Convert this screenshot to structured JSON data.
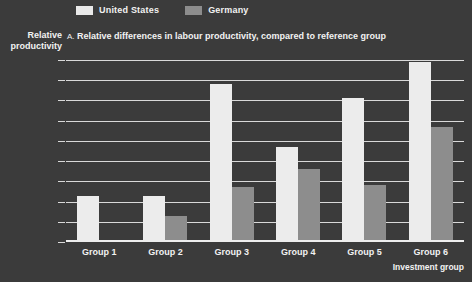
{
  "legend": {
    "position": "top",
    "entries": [
      {
        "label": "United States",
        "color": "#ececec",
        "swatch": "us"
      },
      {
        "label": "Germany",
        "color": "#8d8d8d",
        "swatch": "de"
      }
    ]
  },
  "labels": {
    "y_axis_title_line1": "Relative",
    "y_axis_title_line2": "productivity",
    "panel_letter": "A.",
    "chart_title": "Relative differences in labour productivity, compared to reference group",
    "x_axis_title": "Investment group"
  },
  "chart_data": {
    "type": "bar",
    "title": "A. Relative differences in labour productivity, compared to reference group",
    "xlabel": "Investment group",
    "ylabel": "Relative productivity",
    "categories": [
      "Group 1",
      "Group 2",
      "Group 3",
      "Group 4",
      "Group 5",
      "Group 6"
    ],
    "series": [
      {
        "name": "United States",
        "color": "#ececec",
        "values": [
          0.23,
          0.23,
          0.78,
          0.47,
          0.71,
          0.89
        ]
      },
      {
        "name": "Germany",
        "color": "#8d8d8d",
        "values": [
          0.0,
          0.13,
          0.27,
          0.36,
          0.28,
          0.57
        ]
      }
    ],
    "ylim": [
      0,
      0.9
    ],
    "ytick_labels": [
      "0.9",
      "0.8",
      "0.7",
      "0.6",
      "0.5",
      "0.4",
      "0.3",
      "0.2",
      "0.1",
      "0"
    ],
    "ytick_values": [
      0.9,
      0.8,
      0.7,
      0.6,
      0.5,
      0.4,
      0.3,
      0.2,
      0.1,
      0
    ],
    "grid": true,
    "legend_position": "top"
  },
  "colors": {
    "background": "#3b3b3b",
    "grid": "#d9d9d9",
    "text": "#f2f2f2"
  }
}
